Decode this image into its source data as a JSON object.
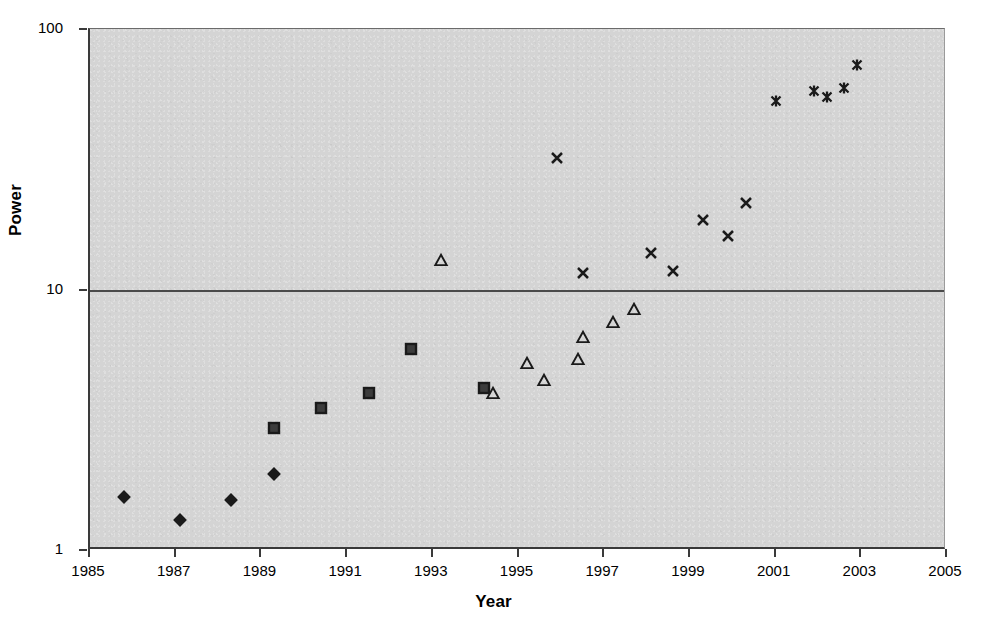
{
  "chart_data": {
    "type": "scatter",
    "title": "",
    "xlabel": "Year",
    "ylabel": "Power",
    "yscale": "log",
    "ylim": [
      1,
      100
    ],
    "xlim": [
      1985,
      2005
    ],
    "grid": "horizontal-decades",
    "legend": "none",
    "background_color": "#d4d4d4",
    "marker_color": "#1a1a1a",
    "y_ticks": [
      "1",
      "10",
      "100"
    ],
    "y_tick_values": [
      1,
      10,
      100
    ],
    "x_ticks": [
      "1985",
      "1987",
      "1989",
      "1991",
      "1993",
      "1995",
      "1997",
      "1999",
      "2001",
      "2003",
      "2005"
    ],
    "x_tick_values": [
      1985,
      1987,
      1989,
      1991,
      1993,
      1995,
      1997,
      1999,
      2001,
      2003,
      2005
    ],
    "series": [
      {
        "name": "Series 1",
        "marker": "diamond",
        "points": [
          {
            "x": 1985.8,
            "y": 1.6
          },
          {
            "x": 1987.1,
            "y": 1.3
          },
          {
            "x": 1988.3,
            "y": 1.55
          },
          {
            "x": 1989.3,
            "y": 1.95
          }
        ]
      },
      {
        "name": "Series 2",
        "marker": "square",
        "points": [
          {
            "x": 1989.3,
            "y": 2.95
          },
          {
            "x": 1990.4,
            "y": 3.5
          },
          {
            "x": 1991.5,
            "y": 4.0
          },
          {
            "x": 1992.5,
            "y": 5.9
          },
          {
            "x": 1994.2,
            "y": 4.2
          }
        ]
      },
      {
        "name": "Series 3",
        "marker": "triangle",
        "points": [
          {
            "x": 1993.2,
            "y": 13.0
          },
          {
            "x": 1994.4,
            "y": 4.0
          },
          {
            "x": 1995.2,
            "y": 5.2
          },
          {
            "x": 1995.6,
            "y": 4.5
          },
          {
            "x": 1996.4,
            "y": 5.4
          },
          {
            "x": 1996.5,
            "y": 6.6
          },
          {
            "x": 1997.2,
            "y": 7.5
          },
          {
            "x": 1997.7,
            "y": 8.4
          }
        ]
      },
      {
        "name": "Series 4",
        "marker": "cross",
        "points": [
          {
            "x": 1995.9,
            "y": 32.0
          },
          {
            "x": 1996.5,
            "y": 11.6
          },
          {
            "x": 1998.1,
            "y": 13.8
          },
          {
            "x": 1998.6,
            "y": 11.8
          },
          {
            "x": 1999.3,
            "y": 18.5
          },
          {
            "x": 1999.9,
            "y": 16.0
          },
          {
            "x": 2000.3,
            "y": 21.5
          }
        ]
      },
      {
        "name": "Series 5",
        "marker": "asterisk",
        "points": [
          {
            "x": 2001.0,
            "y": 53.0
          },
          {
            "x": 2001.9,
            "y": 58.0
          },
          {
            "x": 2002.2,
            "y": 55.0
          },
          {
            "x": 2002.6,
            "y": 59.5
          },
          {
            "x": 2002.9,
            "y": 73.0
          }
        ]
      }
    ]
  }
}
